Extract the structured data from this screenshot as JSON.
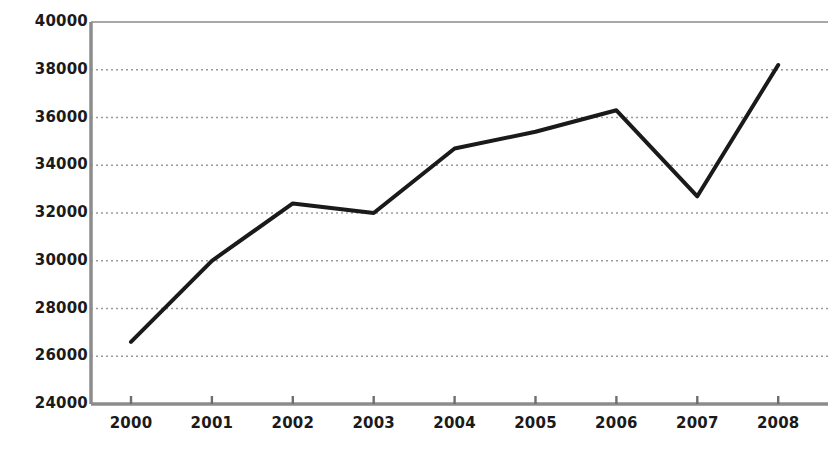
{
  "chart_data": {
    "type": "line",
    "title": "",
    "subtitle": "",
    "xlabel": "",
    "ylabel": "",
    "categories": [
      "2000",
      "2001",
      "2002",
      "2003",
      "2004",
      "2005",
      "2006",
      "2007",
      "2008"
    ],
    "x": [
      2000,
      2001,
      2002,
      2003,
      2004,
      2005,
      2006,
      2007,
      2008
    ],
    "values": [
      26600,
      30000,
      32400,
      32000,
      34700,
      35400,
      36300,
      32700,
      38200
    ],
    "series": [
      {
        "name": "series-1",
        "values": [
          26600,
          30000,
          32400,
          32000,
          34700,
          35400,
          36300,
          32700,
          38200
        ],
        "color": "#1a1a1a",
        "line_width": 4
      }
    ],
    "ylim": [
      24000,
      40000
    ],
    "ytick_labels": [
      "24000",
      "26000",
      "28000",
      "30000",
      "32000",
      "34000",
      "36000",
      "38000",
      "40000"
    ],
    "ytick_values": [
      24000,
      26000,
      28000,
      30000,
      32000,
      34000,
      36000,
      38000,
      40000
    ],
    "xtick_labels": [
      "2000",
      "2001",
      "2002",
      "2003",
      "2004",
      "2005",
      "2006",
      "2007",
      "2008"
    ],
    "grid": true,
    "grid_style": "dotted",
    "grid_color": "#9a9a9a",
    "legend": "none",
    "axis_color": "#8c8c8c",
    "background": "#ffffff"
  },
  "axes": {
    "y_axis_name": "y-axis",
    "x_axis_name": "x-axis"
  }
}
